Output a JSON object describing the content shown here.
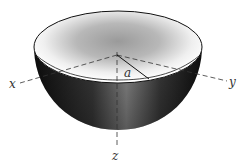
{
  "diagram": {
    "type": "hemisphere",
    "axes": {
      "x_label": "x",
      "y_label": "y",
      "z_label": "z"
    },
    "radius_label": "a",
    "colors": {
      "shell_dark": "#1a1a1a",
      "shell_highlight": "#8a8a8a",
      "interior_light": "#ffffff",
      "interior_shade": "#9a9a9a",
      "outline": "#111111",
      "axis": "#333333"
    }
  }
}
